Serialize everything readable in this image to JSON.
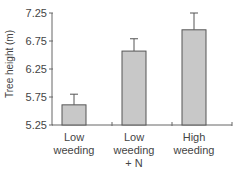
{
  "chart_data": {
    "type": "bar",
    "title": "",
    "xlabel": "",
    "ylabel": "Tree height (m)",
    "ylim": [
      5.25,
      7.25
    ],
    "yticks": [
      "5.25",
      "5.75",
      "6.25",
      "6.75",
      "7.25"
    ],
    "grid": false,
    "legend": null,
    "categories": [
      "Low weeding",
      "Low weeding + N",
      "High weeding"
    ],
    "category_label_lines": [
      [
        "Low",
        "weeding"
      ],
      [
        "Low",
        "weeding",
        "+ N"
      ],
      [
        "High",
        "weeding"
      ]
    ],
    "values": [
      5.61,
      6.57,
      6.95
    ],
    "error_upper": [
      5.8,
      6.79,
      7.25
    ],
    "bar_color": "#c8c8c8",
    "bar_edge_color": "#555555"
  }
}
